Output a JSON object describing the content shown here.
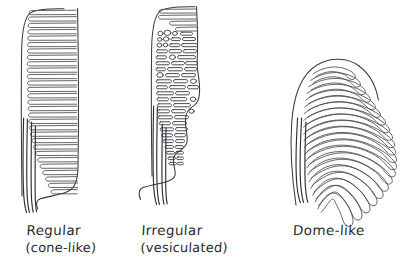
{
  "figure": {
    "background_color": "#ffffff",
    "ink_color": "#3a3a3e",
    "style": "hand-drawn pen sketch",
    "panel_count": 3
  },
  "panels": [
    {
      "id": "regular-cone-like",
      "caption_line1": "Regular",
      "caption_line2": "(cone-like)",
      "shape": "cone",
      "lamellae_count": 29,
      "vesiculated": false,
      "stalk_lines": 4
    },
    {
      "id": "irregular-vesiculated",
      "caption_line1": "Irregular",
      "caption_line2": "(vesiculated)",
      "shape": "cone",
      "lamellae_count": 24,
      "vesiculated": true,
      "vesicle_count": 96,
      "stalk_lines": 4
    },
    {
      "id": "dome-like",
      "caption_line1": "Dome-like",
      "caption_line2": "",
      "shape": "dome",
      "lamellae_count": 21,
      "vesiculated": false,
      "stalk_lines": 3
    }
  ]
}
